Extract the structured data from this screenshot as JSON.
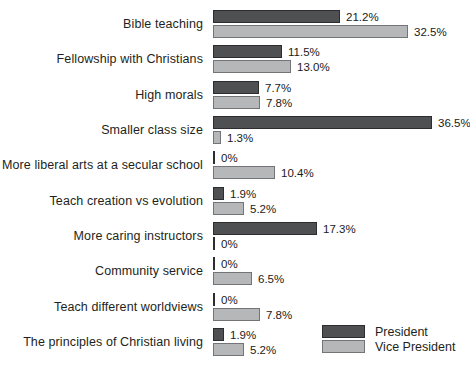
{
  "chart_data": {
    "type": "bar",
    "orientation": "horizontal",
    "title": "",
    "xlabel": "",
    "ylabel": "",
    "grid": false,
    "value_suffix": "%",
    "xlim": [
      0,
      36.5
    ],
    "legend_position": "bottom-right",
    "categories": [
      "Bible teaching",
      "Fellowship with Christians",
      "High morals",
      "Smaller class size",
      "More liberal arts at a secular school",
      "Teach creation vs evolution",
      "More caring instructors",
      "Community service",
      "Teach different worldviews",
      "The principles of Christian living"
    ],
    "series": [
      {
        "name": "President",
        "color": "#4f5052",
        "border_color": "#2d2d2f",
        "values": [
          21.2,
          11.5,
          7.7,
          36.5,
          0,
          1.9,
          17.3,
          0,
          0,
          1.9
        ],
        "labels": [
          "21.2%",
          "11.5%",
          "7.7%",
          "36.5%",
          "0%",
          "1.9%",
          "17.3%",
          "0%",
          "0%",
          "1.9%"
        ]
      },
      {
        "name": "Vice President",
        "color": "#b6b7b9",
        "border_color": "#737477",
        "values": [
          32.5,
          13.0,
          7.8,
          1.3,
          10.4,
          5.2,
          0,
          6.5,
          7.8,
          5.2
        ],
        "labels": [
          "32.5%",
          "13.0%",
          "7.8%",
          "1.3%",
          "10.4%",
          "5.2%",
          "0%",
          "6.5%",
          "7.8%",
          "5.2%"
        ]
      }
    ]
  },
  "legend": {
    "president_label": "President",
    "vice_president_label": "Vice President"
  }
}
